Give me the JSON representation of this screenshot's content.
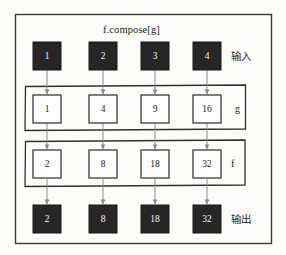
{
  "diagram": {
    "title": "f.compose[g]",
    "side_labels": {
      "input": "输入",
      "output": "输出"
    },
    "group_labels": {
      "g": "g",
      "f": "f"
    },
    "rows": [
      {
        "id": "input-row",
        "style": "dark",
        "values": [
          "1",
          "2",
          "3",
          "4"
        ]
      },
      {
        "id": "g-row",
        "style": "light",
        "values": [
          "1",
          "4",
          "9",
          "16"
        ]
      },
      {
        "id": "f-row",
        "style": "light",
        "values": [
          "2",
          "8",
          "18",
          "32"
        ]
      },
      {
        "id": "output-row",
        "style": "dark",
        "values": [
          "2",
          "8",
          "18",
          "32"
        ]
      }
    ],
    "colors": {
      "dark_box_fill": "#262626",
      "dark_box_text": "#f2f2f2",
      "light_box_fill": "#ffffff",
      "light_box_stroke": "#2b2b2b",
      "arrow": "#8a8a8a",
      "frame": "#3a3a3a",
      "background": "#fdfdfc"
    }
  }
}
